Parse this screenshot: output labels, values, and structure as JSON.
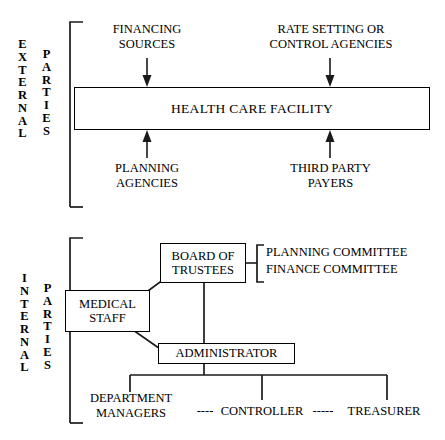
{
  "diagram": {
    "sections": [
      {
        "id": "external",
        "label_word_1": "EXTERNAL",
        "label_word_2": "PARTIES"
      },
      {
        "id": "internal",
        "label_word_1": "INTERNAL",
        "label_word_2": "PARTIES"
      }
    ],
    "external": {
      "center_box": "HEALTH CARE FACILITY",
      "top_left_label": "FINANCING\nSOURCES",
      "top_right_label": "RATE SETTING OR\nCONTROL AGENCIES",
      "bottom_left_label": "PLANNING\nAGENCIES",
      "bottom_right_label": "THIRD PARTY\nPAYERS",
      "arrows": [
        {
          "name": "financing-sources-arrow",
          "direction": "down"
        },
        {
          "name": "rate-setting-arrow",
          "direction": "down"
        },
        {
          "name": "planning-agencies-arrow",
          "direction": "up"
        },
        {
          "name": "third-party-payers-arrow",
          "direction": "up"
        }
      ]
    },
    "internal": {
      "board_box": "BOARD OF\nTRUSTEES",
      "medical_staff_box": "MEDICAL\nSTAFF",
      "administrator_box": "ADMINISTRATOR",
      "committee_1": "PLANNING COMMITTEE",
      "committee_2": "FINANCE COMMITTEE",
      "department_managers": "DEPARTMENT\nMANAGERS",
      "controller": "CONTROLLER",
      "treasurer": "TREASURER",
      "dash_connector_left": "----",
      "dash_connector_right": "-----"
    },
    "colors": {
      "stroke": "#1a1a1a",
      "text": "#000000",
      "background": "#ffffff"
    }
  }
}
